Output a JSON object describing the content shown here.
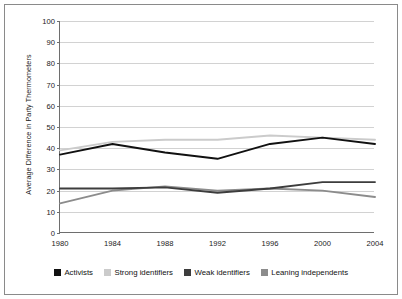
{
  "chart_data": {
    "type": "line",
    "title": "",
    "xlabel": "",
    "ylabel": "Average Difference in Party Thermometers",
    "categories": [
      "1980",
      "1984",
      "1988",
      "1992",
      "1996",
      "2000",
      "2004"
    ],
    "x": [
      1980,
      1984,
      1988,
      1992,
      1996,
      2000,
      2004
    ],
    "ylim": [
      0,
      100
    ],
    "yticks": [
      0,
      10,
      20,
      30,
      40,
      50,
      60,
      70,
      80,
      90,
      100
    ],
    "ytick_labels": [
      "0",
      "10",
      "20",
      "30",
      "40",
      "50",
      "60",
      "70",
      "80",
      "90",
      "100"
    ],
    "grid": true,
    "legend_position": "bottom",
    "series": [
      {
        "name": "Activists",
        "color": "#111111",
        "values": [
          37,
          42,
          38,
          35,
          42,
          45,
          42
        ]
      },
      {
        "name": "Strong identifiers",
        "color": "#cbcbcb",
        "values": [
          39,
          43,
          44,
          44,
          46,
          45,
          44
        ]
      },
      {
        "name": "Weak identifiers",
        "color": "#3d3d3d",
        "values": [
          21,
          21,
          21.5,
          19,
          21,
          24,
          24
        ]
      },
      {
        "name": "Leaning independents",
        "color": "#8c8c8c",
        "values": [
          14,
          20,
          22,
          20,
          21,
          20,
          17
        ]
      }
    ]
  },
  "axis": {
    "y_title": "Average Difference in Party Thermometers"
  },
  "legend": {
    "items": [
      {
        "label": "Activists",
        "color": "#111111"
      },
      {
        "label": "Strong identifiers",
        "color": "#cbcbcb"
      },
      {
        "label": "Weak identifiers",
        "color": "#3d3d3d"
      },
      {
        "label": "Leaning independents",
        "color": "#8c8c8c"
      }
    ]
  }
}
